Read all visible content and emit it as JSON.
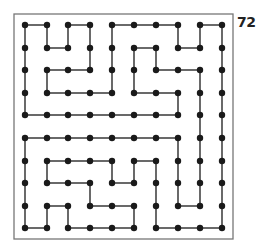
{
  "puzzle": {
    "number_label": "72",
    "grid": {
      "cols": 10,
      "rows": 10
    },
    "colors": {
      "line": "#444444",
      "dot": "#1a1a1a",
      "frame": "#777777",
      "background": "#ffffff"
    },
    "horizontal_edges": {
      "0": [
        [
          0,
          1
        ],
        [
          2,
          3
        ],
        [
          4,
          5
        ],
        [
          5,
          6
        ],
        [
          6,
          7
        ],
        [
          8,
          9
        ]
      ],
      "1": [
        [
          1,
          2
        ],
        [
          5,
          6
        ],
        [
          7,
          8
        ]
      ],
      "2": [
        [
          1,
          2
        ],
        [
          2,
          3
        ],
        [
          6,
          7
        ],
        [
          7,
          8
        ]
      ],
      "3": [
        [
          1,
          2
        ],
        [
          2,
          3
        ],
        [
          3,
          4
        ],
        [
          5,
          6
        ],
        [
          6,
          7
        ]
      ],
      "4": [
        [
          0,
          1
        ],
        [
          1,
          2
        ],
        [
          2,
          3
        ],
        [
          3,
          4
        ],
        [
          4,
          5
        ],
        [
          5,
          6
        ],
        [
          6,
          7
        ]
      ],
      "5": [
        [
          0,
          1
        ],
        [
          1,
          2
        ],
        [
          2,
          3
        ],
        [
          3,
          4
        ],
        [
          4,
          5
        ],
        [
          5,
          6
        ],
        [
          6,
          7
        ]
      ],
      "6": [
        [
          1,
          2
        ],
        [
          2,
          3
        ],
        [
          3,
          4
        ],
        [
          5,
          6
        ]
      ],
      "7": [
        [
          1,
          2
        ],
        [
          2,
          3
        ],
        [
          4,
          5
        ]
      ],
      "8": [
        [
          1,
          2
        ],
        [
          3,
          4
        ],
        [
          4,
          5
        ],
        [
          7,
          8
        ]
      ],
      "9": [
        [
          0,
          1
        ],
        [
          2,
          3
        ],
        [
          3,
          4
        ],
        [
          4,
          5
        ],
        [
          6,
          7
        ],
        [
          7,
          8
        ],
        [
          8,
          9
        ]
      ]
    },
    "vertical_edges": {
      "0": [
        [
          0,
          1
        ],
        [
          1,
          2
        ],
        [
          2,
          3
        ],
        [
          3,
          4
        ],
        [
          5,
          6
        ],
        [
          6,
          7
        ],
        [
          7,
          8
        ],
        [
          8,
          9
        ]
      ],
      "1": [
        [
          0,
          1
        ],
        [
          2,
          3
        ],
        [
          6,
          7
        ],
        [
          8,
          9
        ]
      ],
      "2": [
        [
          0,
          1
        ],
        [
          8,
          9
        ]
      ],
      "3": [
        [
          0,
          1
        ],
        [
          1,
          2
        ],
        [
          7,
          8
        ]
      ],
      "4": [
        [
          0,
          1
        ],
        [
          1,
          2
        ],
        [
          2,
          3
        ],
        [
          6,
          7
        ]
      ],
      "5": [
        [
          1,
          2
        ],
        [
          2,
          3
        ],
        [
          6,
          7
        ],
        [
          8,
          9
        ]
      ],
      "6": [
        [
          1,
          2
        ],
        [
          6,
          7
        ],
        [
          7,
          8
        ],
        [
          8,
          9
        ]
      ],
      "7": [
        [
          0,
          1
        ],
        [
          3,
          4
        ],
        [
          5,
          6
        ],
        [
          6,
          7
        ],
        [
          7,
          8
        ]
      ],
      "8": [
        [
          0,
          1
        ],
        [
          2,
          3
        ],
        [
          3,
          4
        ],
        [
          4,
          5
        ],
        [
          5,
          6
        ],
        [
          6,
          7
        ],
        [
          7,
          8
        ]
      ],
      "9": [
        [
          0,
          1
        ],
        [
          1,
          2
        ],
        [
          2,
          3
        ],
        [
          3,
          4
        ],
        [
          4,
          5
        ],
        [
          5,
          6
        ],
        [
          6,
          7
        ],
        [
          7,
          8
        ],
        [
          8,
          9
        ]
      ]
    }
  }
}
